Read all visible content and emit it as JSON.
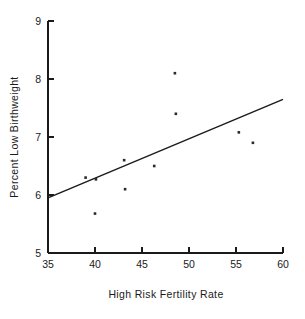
{
  "chart_data": {
    "type": "scatter",
    "title": "",
    "xlabel": "High Risk Fertility Rate",
    "ylabel": "Percent Low Birthweight",
    "xlim": [
      35,
      60
    ],
    "ylim": [
      5,
      9
    ],
    "xticks": [
      35,
      40,
      45,
      50,
      55,
      60
    ],
    "yticks": [
      5,
      6,
      7,
      8,
      9
    ],
    "xtick_labels": [
      "35",
      "40",
      "45",
      "50",
      "55",
      "60"
    ],
    "ytick_labels": [
      "5",
      "6",
      "7",
      "8",
      "9"
    ],
    "grid": false,
    "legend": null,
    "marker": "small-square-dot",
    "point_color": "#2a2a2a",
    "line_color": "#1a1a1a",
    "points": [
      {
        "x": 39.0,
        "y": 6.3
      },
      {
        "x": 40.0,
        "y": 5.68
      },
      {
        "x": 40.1,
        "y": 6.27
      },
      {
        "x": 43.1,
        "y": 6.6
      },
      {
        "x": 43.2,
        "y": 6.1
      },
      {
        "x": 46.3,
        "y": 6.5
      },
      {
        "x": 48.5,
        "y": 8.1
      },
      {
        "x": 48.6,
        "y": 7.4
      },
      {
        "x": 55.3,
        "y": 7.08
      },
      {
        "x": 56.8,
        "y": 6.9
      }
    ],
    "fit_line": {
      "type": "linear-regression",
      "x0": 35,
      "y0": 5.95,
      "x1": 60,
      "y1": 7.65
    }
  },
  "labels": {
    "x_axis_title": "High Risk Fertility Rate",
    "y_axis_title": "Percent Low Birthweight"
  }
}
